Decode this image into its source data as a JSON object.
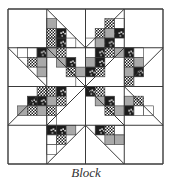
{
  "caption": "Block",
  "colors": {
    "outline": "#3a3a3a",
    "gray": "#a9a9a9",
    "black": "#1c1c1c",
    "white": "#ffffff"
  },
  "block": {
    "x": 8,
    "y": 9,
    "size": 155,
    "grid": 4,
    "cells": [
      {
        "r": 0,
        "c": 0,
        "diag": "none",
        "patches": []
      },
      {
        "r": 0,
        "c": 1,
        "diag": "tl-br",
        "patches": [
          {
            "sx": 0,
            "sy": 1,
            "w": 1,
            "h": 1,
            "f": "gray"
          },
          {
            "sx": 0,
            "sy": 2,
            "w": 1,
            "h": 1,
            "f": "check"
          },
          {
            "sx": 1,
            "sy": 2,
            "w": 1,
            "h": 1,
            "f": "black"
          },
          {
            "sx": 0,
            "sy": 3,
            "w": 1,
            "h": 1,
            "f": "check"
          },
          {
            "sx": 1,
            "sy": 3,
            "w": 1,
            "h": 1,
            "f": "black"
          },
          {
            "sx": 2,
            "sy": 3,
            "w": 1,
            "h": 1,
            "f": "white"
          }
        ]
      },
      {
        "r": 0,
        "c": 2,
        "diag": "bl-tr",
        "patches": [
          {
            "sx": 2,
            "sy": 1,
            "w": 1,
            "h": 1,
            "f": "check"
          },
          {
            "sx": 3,
            "sy": 1,
            "w": 1,
            "h": 1,
            "f": "white"
          },
          {
            "sx": 1,
            "sy": 2,
            "w": 1,
            "h": 1,
            "f": "check"
          },
          {
            "sx": 2,
            "sy": 2,
            "w": 1,
            "h": 1,
            "f": "gray"
          },
          {
            "sx": 3,
            "sy": 2,
            "w": 1,
            "h": 1,
            "f": "black"
          },
          {
            "sx": 0,
            "sy": 3,
            "w": 1,
            "h": 1,
            "f": "white"
          },
          {
            "sx": 1,
            "sy": 3,
            "w": 1,
            "h": 1,
            "f": "gray"
          },
          {
            "sx": 2,
            "sy": 3,
            "w": 1,
            "h": 1,
            "f": "black"
          }
        ]
      },
      {
        "r": 0,
        "c": 3,
        "diag": "none",
        "patches": []
      },
      {
        "r": 1,
        "c": 0,
        "diag": "tl-br",
        "patches": [
          {
            "sx": 1,
            "sy": 0,
            "w": 1,
            "h": 1,
            "f": "white"
          },
          {
            "sx": 2,
            "sy": 0,
            "w": 1,
            "h": 1,
            "f": "white"
          },
          {
            "sx": 3,
            "sy": 0,
            "w": 1,
            "h": 1,
            "f": "black"
          },
          {
            "sx": 2,
            "sy": 1,
            "w": 1,
            "h": 1,
            "f": "check"
          },
          {
            "sx": 3,
            "sy": 1,
            "w": 1,
            "h": 1,
            "f": "gray"
          },
          {
            "sx": 3,
            "sy": 2,
            "w": 1,
            "h": 1,
            "f": "gray"
          }
        ]
      },
      {
        "r": 1,
        "c": 1,
        "diag": "tl-br",
        "patches": [
          {
            "sx": 0,
            "sy": 0,
            "w": 1,
            "h": 1,
            "f": "gray"
          },
          {
            "sx": 1,
            "sy": 0,
            "w": 1,
            "h": 1,
            "f": "check"
          },
          {
            "sx": 1,
            "sy": 1,
            "w": 1,
            "h": 1,
            "f": "gray"
          },
          {
            "sx": 2,
            "sy": 1,
            "w": 1,
            "h": 1,
            "f": "black"
          },
          {
            "sx": 2,
            "sy": 2,
            "w": 1,
            "h": 1,
            "f": "check"
          },
          {
            "sx": 3,
            "sy": 2,
            "w": 1,
            "h": 1,
            "f": "gray"
          },
          {
            "sx": 3,
            "sy": 3,
            "w": 1,
            "h": 1,
            "f": "white"
          }
        ]
      },
      {
        "r": 1,
        "c": 2,
        "diag": "bl-tr",
        "patches": [
          {
            "sx": 1,
            "sy": 0,
            "w": 1,
            "h": 1,
            "f": "black"
          },
          {
            "sx": 2,
            "sy": 0,
            "w": 1,
            "h": 1,
            "f": "check"
          },
          {
            "sx": 3,
            "sy": 0,
            "w": 1,
            "h": 1,
            "f": "gray"
          },
          {
            "sx": 0,
            "sy": 1,
            "w": 1,
            "h": 1,
            "f": "gray"
          },
          {
            "sx": 1,
            "sy": 1,
            "w": 1,
            "h": 1,
            "f": "black"
          },
          {
            "sx": 0,
            "sy": 2,
            "w": 1,
            "h": 1,
            "f": "black"
          },
          {
            "sx": 1,
            "sy": 2,
            "w": 1,
            "h": 1,
            "f": "check"
          }
        ]
      },
      {
        "r": 1,
        "c": 3,
        "diag": "bl-tr",
        "patches": [
          {
            "sx": 0,
            "sy": 0,
            "w": 1,
            "h": 1,
            "f": "black"
          },
          {
            "sx": 1,
            "sy": 0,
            "w": 1,
            "h": 1,
            "f": "white"
          },
          {
            "sx": 0,
            "sy": 1,
            "w": 1,
            "h": 1,
            "f": "check"
          },
          {
            "sx": 1,
            "sy": 1,
            "w": 1,
            "h": 1,
            "f": "gray"
          },
          {
            "sx": 0,
            "sy": 2,
            "w": 1,
            "h": 1,
            "f": "gray"
          },
          {
            "sx": 1,
            "sy": 2,
            "w": 1,
            "h": 1,
            "f": "black"
          },
          {
            "sx": 0,
            "sy": 3,
            "w": 1,
            "h": 1,
            "f": "check"
          }
        ]
      },
      {
        "r": 2,
        "c": 0,
        "diag": "bl-tr",
        "patches": [
          {
            "sx": 3,
            "sy": 0,
            "w": 1,
            "h": 1,
            "f": "check"
          },
          {
            "sx": 2,
            "sy": 1,
            "w": 1,
            "h": 1,
            "f": "black"
          },
          {
            "sx": 3,
            "sy": 1,
            "w": 1,
            "h": 1,
            "f": "black"
          },
          {
            "sx": 1,
            "sy": 2,
            "w": 1,
            "h": 1,
            "f": "gray"
          },
          {
            "sx": 2,
            "sy": 2,
            "w": 1,
            "h": 1,
            "f": "check"
          },
          {
            "sx": 3,
            "sy": 2,
            "w": 1,
            "h": 1,
            "f": "gray"
          }
        ]
      },
      {
        "r": 2,
        "c": 1,
        "diag": "bl-tr",
        "patches": [
          {
            "sx": 0,
            "sy": 0,
            "w": 1,
            "h": 1,
            "f": "check"
          },
          {
            "sx": 1,
            "sy": 0,
            "w": 1,
            "h": 1,
            "f": "black"
          },
          {
            "sx": 0,
            "sy": 1,
            "w": 1,
            "h": 1,
            "f": "gray"
          },
          {
            "sx": 1,
            "sy": 1,
            "w": 1,
            "h": 1,
            "f": "check"
          },
          {
            "sx": 0,
            "sy": 2,
            "w": 1,
            "h": 1,
            "f": "check"
          },
          {
            "sx": 0,
            "sy": 3,
            "w": 1,
            "h": 1,
            "f": "white"
          }
        ]
      },
      {
        "r": 2,
        "c": 2,
        "diag": "tl-br",
        "patches": [
          {
            "sx": 0,
            "sy": 0,
            "w": 1,
            "h": 1,
            "f": "black"
          },
          {
            "sx": 1,
            "sy": 0,
            "w": 1,
            "h": 1,
            "f": "check"
          },
          {
            "sx": 1,
            "sy": 1,
            "w": 1,
            "h": 1,
            "f": "gray"
          },
          {
            "sx": 2,
            "sy": 1,
            "w": 1,
            "h": 1,
            "f": "black"
          },
          {
            "sx": 2,
            "sy": 2,
            "w": 1,
            "h": 1,
            "f": "check"
          },
          {
            "sx": 3,
            "sy": 2,
            "w": 1,
            "h": 1,
            "f": "gray"
          }
        ]
      },
      {
        "r": 2,
        "c": 3,
        "diag": "tl-br",
        "patches": [
          {
            "sx": 0,
            "sy": 1,
            "w": 1,
            "h": 1,
            "f": "gray"
          },
          {
            "sx": 1,
            "sy": 1,
            "w": 1,
            "h": 1,
            "f": "check"
          },
          {
            "sx": 0,
            "sy": 2,
            "w": 1,
            "h": 1,
            "f": "black"
          },
          {
            "sx": 1,
            "sy": 2,
            "w": 1,
            "h": 1,
            "f": "white"
          },
          {
            "sx": 2,
            "sy": 2,
            "w": 1,
            "h": 1,
            "f": "white"
          }
        ]
      },
      {
        "r": 3,
        "c": 0,
        "diag": "none",
        "patches": []
      },
      {
        "r": 3,
        "c": 1,
        "diag": "bl-tr",
        "patches": [
          {
            "sx": 0,
            "sy": 0,
            "w": 1,
            "h": 1,
            "f": "black"
          },
          {
            "sx": 1,
            "sy": 0,
            "w": 1,
            "h": 1,
            "f": "black"
          },
          {
            "sx": 2,
            "sy": 0,
            "w": 1,
            "h": 1,
            "f": "gray"
          },
          {
            "sx": 0,
            "sy": 1,
            "w": 1,
            "h": 1,
            "f": "white"
          },
          {
            "sx": 1,
            "sy": 1,
            "w": 1,
            "h": 1,
            "f": "check"
          },
          {
            "sx": 0,
            "sy": 2,
            "w": 1,
            "h": 1,
            "f": "white"
          }
        ]
      },
      {
        "r": 3,
        "c": 2,
        "diag": "tl-br",
        "patches": [
          {
            "sx": 1,
            "sy": 0,
            "w": 1,
            "h": 1,
            "f": "black"
          },
          {
            "sx": 2,
            "sy": 0,
            "w": 1,
            "h": 1,
            "f": "check"
          },
          {
            "sx": 3,
            "sy": 0,
            "w": 1,
            "h": 1,
            "f": "white"
          },
          {
            "sx": 2,
            "sy": 1,
            "w": 1,
            "h": 1,
            "f": "gray"
          },
          {
            "sx": 3,
            "sy": 1,
            "w": 1,
            "h": 1,
            "f": "gray"
          }
        ]
      },
      {
        "r": 3,
        "c": 3,
        "diag": "none",
        "patches": []
      }
    ]
  }
}
